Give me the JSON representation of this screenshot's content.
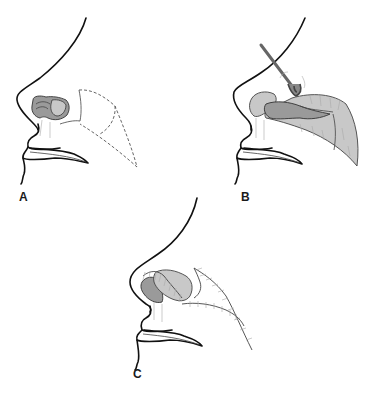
{
  "figure": {
    "panels": [
      {
        "label": "A",
        "stage": "flap outlined with dashed lines on cheek lateral to nasal ala defect"
      },
      {
        "label": "B",
        "stage": "flap elevated with skin hook and rotated toward nasal defect"
      },
      {
        "label": "C",
        "stage": "flap inset and sutured, donor site closed"
      }
    ],
    "colors": {
      "line": "#111111",
      "tissue_dark": "#9a9a9a",
      "tissue_light": "#c8c8c8",
      "background": "#ffffff"
    }
  }
}
